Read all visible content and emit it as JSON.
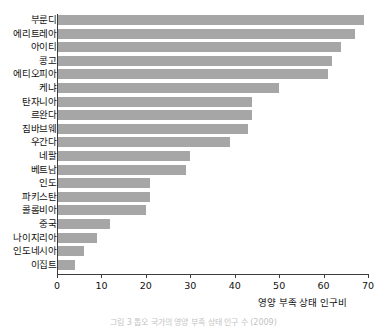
{
  "chart_data": {
    "type": "bar",
    "orientation": "horizontal",
    "title": "",
    "xlabel": "영양 부족 상태 인구비",
    "ylabel": "",
    "xlim": [
      0,
      70
    ],
    "xticks": [
      0,
      10,
      20,
      30,
      40,
      50,
      60,
      70
    ],
    "xtick_labels": [
      "0",
      "10",
      "20",
      "30",
      "40",
      "50",
      "60",
      "70"
    ],
    "grid": false,
    "legend": null,
    "bar_color": "#a6a6a6",
    "categories": [
      "부룬디",
      "에리트레아",
      "아이티",
      "콩고",
      "에티오피아",
      "케냐",
      "탄자니아",
      "르완다",
      "짐바브웨",
      "우간다",
      "네팔",
      "베트남",
      "인도",
      "파키스탄",
      "콜롬비아",
      "중국",
      "나이지리아",
      "인도네시아",
      "이집트"
    ],
    "values": [
      69,
      67,
      64,
      62,
      61,
      50,
      44,
      44,
      43,
      39,
      30,
      29,
      21,
      21,
      20,
      12,
      9,
      6,
      4
    ]
  },
  "caption": {
    "text": "그림 3  톱오 국가의 영양 부족 상태 인구 수 (2009)"
  }
}
